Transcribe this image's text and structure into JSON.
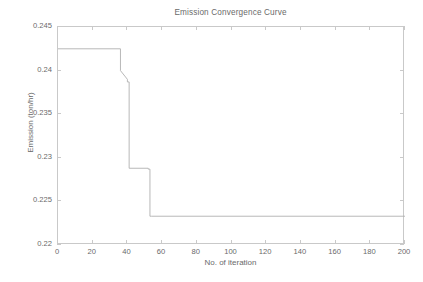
{
  "chart_data": {
    "type": "line",
    "title": "Emission Convergence Curve",
    "xlabel": "No. of iteration",
    "ylabel": "Emission (ton/hr)",
    "xlim": [
      0,
      200
    ],
    "ylim": [
      0.22,
      0.245
    ],
    "xticks": [
      0,
      20,
      40,
      60,
      80,
      100,
      120,
      140,
      160,
      180,
      200
    ],
    "xtick_labels": [
      "0",
      "20",
      "40",
      "60",
      "80",
      "100",
      "120",
      "140",
      "160",
      "180",
      "200"
    ],
    "yticks": [
      0.22,
      0.225,
      0.23,
      0.235,
      0.24,
      0.245
    ],
    "ytick_labels": [
      "0.22",
      "0.225",
      "0.23",
      "0.235",
      "0.24",
      "0.245"
    ],
    "grid": false,
    "legend": null,
    "line_color": "#b0b0b0",
    "axis_color": "#c9c9c9",
    "text_color": "#6a6a6a",
    "series": [
      {
        "name": "Emission",
        "step": true,
        "x": [
          0,
          36,
          36,
          40,
          40,
          41,
          41,
          52,
          52,
          53,
          53,
          54,
          54,
          200
        ],
        "y": [
          0.2425,
          0.2425,
          0.24,
          0.239,
          0.2387,
          0.2387,
          0.2288,
          0.2288,
          0.2287,
          0.2287,
          0.2233,
          0.2233,
          0.2233,
          0.2233
        ],
        "plateaus": [
          {
            "from_iteration": 0,
            "to_iteration": 36,
            "value": 0.2425
          },
          {
            "from_iteration": 36,
            "to_iteration": 41,
            "value": 0.2387
          },
          {
            "from_iteration": 41,
            "to_iteration": 52,
            "value": 0.2288
          },
          {
            "from_iteration": 52,
            "to_iteration": 54,
            "value": 0.2287
          },
          {
            "from_iteration": 54,
            "to_iteration": 200,
            "value": 0.2233
          }
        ]
      }
    ]
  }
}
